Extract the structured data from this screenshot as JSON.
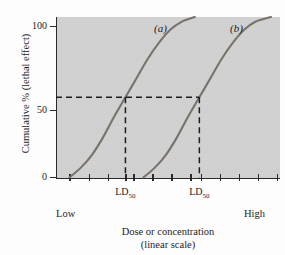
{
  "chart_data": {
    "type": "line",
    "title": "",
    "xlabel": "Dose or concentration",
    "xlabel_line2": "(linear scale)",
    "ylabel": "Cumulative % (lethal effect)",
    "xlim_labels": {
      "low": "Low",
      "high": "High"
    },
    "ylim": [
      0,
      100
    ],
    "ytick_labels": [
      "0",
      "50",
      "100"
    ],
    "ytick_values": [
      0,
      50,
      100
    ],
    "grid": false,
    "legend_position": "inline-curve-labels",
    "plot_background": "#d2d2d2",
    "curve_color": "#7a736b",
    "axis_color": "#2a2a2a",
    "annotations": [
      {
        "name": "ld50-a",
        "text": "LD",
        "subscript": "50"
      },
      {
        "name": "ld50-b",
        "text": "LD",
        "subscript": "50"
      }
    ],
    "series": [
      {
        "name": "(a)",
        "label": "(a)",
        "ld50_x_fraction": 0.31,
        "x": [
          0.06,
          0.11,
          0.16,
          0.21,
          0.26,
          0.31,
          0.36,
          0.41,
          0.46,
          0.51,
          0.56,
          0.62
        ],
        "values": [
          0,
          6,
          14,
          25,
          38,
          50,
          62,
          74,
          84,
          92,
          97,
          100
        ]
      },
      {
        "name": "(b)",
        "label": "(b)",
        "ld50_x_fraction": 0.64,
        "x": [
          0.39,
          0.44,
          0.49,
          0.54,
          0.59,
          0.64,
          0.69,
          0.74,
          0.79,
          0.84,
          0.89,
          0.96
        ],
        "values": [
          0,
          6,
          14,
          25,
          38,
          50,
          62,
          74,
          84,
          92,
          97,
          100
        ]
      }
    ],
    "reference_lines": [
      {
        "name": "fifty-percent-horizontal",
        "orientation": "horizontal",
        "value": 50,
        "style": "dashed"
      },
      {
        "name": "ld50-a-vertical",
        "orientation": "vertical",
        "value_fraction": 0.31,
        "style": "dashed"
      },
      {
        "name": "ld50-b-vertical",
        "orientation": "vertical",
        "value_fraction": 0.64,
        "style": "dashed"
      }
    ],
    "xtick_fractions": [
      0.06,
      0.145,
      0.23,
      0.31,
      0.345,
      0.43,
      0.515,
      0.6,
      0.645,
      0.73,
      0.815,
      0.9,
      0.985
    ]
  },
  "axes": {
    "y_label": "Cumulative % (lethal effect)",
    "y_ticks": [
      "100",
      "50",
      "0"
    ],
    "x_title_line1": "Dose or concentration",
    "x_title_line2": "(linear scale)",
    "x_low": "Low",
    "x_high": "High"
  },
  "labels": {
    "curve_a": "(a)",
    "curve_b": "(b)",
    "ld50_prefix": "LD",
    "ld50_sub": "50"
  }
}
